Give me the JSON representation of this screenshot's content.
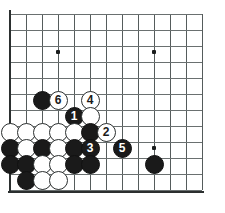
{
  "figure": {
    "board_type": "go-board",
    "grid": {
      "cols": 13,
      "rows": 12,
      "spacing_px": 16,
      "origin_x": 10,
      "origin_y": 14,
      "line_color": "#555c5c",
      "edge_color": "#2b2f2f",
      "background_color": "#ffffff"
    },
    "star_points": [
      {
        "x": 58,
        "y": 52
      },
      {
        "x": 154,
        "y": 52
      },
      {
        "x": 154,
        "y": 148
      }
    ],
    "stone_colors": {
      "black": "#1a1a1a",
      "white": "#ffffff",
      "black_label": "#ffffff",
      "white_label": "#1a1a1a"
    },
    "stones": [
      {
        "color": "black",
        "x": 42,
        "y": 100,
        "label": ""
      },
      {
        "color": "white",
        "x": 58,
        "y": 100,
        "label": "6"
      },
      {
        "color": "white",
        "x": 90,
        "y": 100,
        "label": "4"
      },
      {
        "color": "black",
        "x": 74,
        "y": 116,
        "label": "1"
      },
      {
        "color": "white",
        "x": 90,
        "y": 116,
        "label": ""
      },
      {
        "color": "white",
        "x": 10,
        "y": 132,
        "label": ""
      },
      {
        "color": "white",
        "x": 26,
        "y": 132,
        "label": ""
      },
      {
        "color": "white",
        "x": 42,
        "y": 132,
        "label": ""
      },
      {
        "color": "white",
        "x": 58,
        "y": 132,
        "label": ""
      },
      {
        "color": "white",
        "x": 74,
        "y": 132,
        "label": ""
      },
      {
        "color": "black",
        "x": 90,
        "y": 132,
        "label": ""
      },
      {
        "color": "white",
        "x": 106,
        "y": 132,
        "label": "2"
      },
      {
        "color": "black",
        "x": 10,
        "y": 148,
        "label": ""
      },
      {
        "color": "white",
        "x": 26,
        "y": 148,
        "label": ""
      },
      {
        "color": "black",
        "x": 42,
        "y": 148,
        "label": ""
      },
      {
        "color": "white",
        "x": 58,
        "y": 148,
        "label": ""
      },
      {
        "color": "black",
        "x": 74,
        "y": 148,
        "label": ""
      },
      {
        "color": "black",
        "x": 90,
        "y": 148,
        "label": "3"
      },
      {
        "color": "black",
        "x": 122,
        "y": 148,
        "label": "5"
      },
      {
        "color": "black",
        "x": 10,
        "y": 164,
        "label": ""
      },
      {
        "color": "black",
        "x": 26,
        "y": 164,
        "label": ""
      },
      {
        "color": "white",
        "x": 42,
        "y": 164,
        "label": ""
      },
      {
        "color": "white",
        "x": 58,
        "y": 164,
        "label": ""
      },
      {
        "color": "black",
        "x": 74,
        "y": 164,
        "label": ""
      },
      {
        "color": "black",
        "x": 90,
        "y": 164,
        "label": ""
      },
      {
        "color": "black",
        "x": 154,
        "y": 164,
        "label": ""
      },
      {
        "color": "black",
        "x": 26,
        "y": 180,
        "label": ""
      },
      {
        "color": "white",
        "x": 42,
        "y": 180,
        "label": ""
      },
      {
        "color": "white",
        "x": 58,
        "y": 180,
        "label": ""
      }
    ],
    "move_sequence": [
      {
        "number": "1",
        "color": "black"
      },
      {
        "number": "2",
        "color": "white"
      },
      {
        "number": "3",
        "color": "black"
      },
      {
        "number": "4",
        "color": "white"
      },
      {
        "number": "5",
        "color": "black"
      },
      {
        "number": "6",
        "color": "white"
      }
    ]
  }
}
